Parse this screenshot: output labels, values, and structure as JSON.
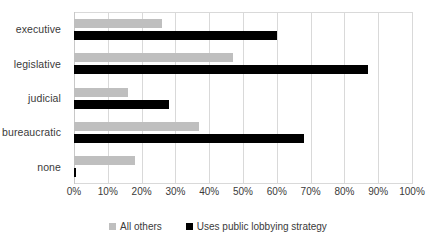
{
  "chart_data": {
    "type": "bar",
    "orientation": "horizontal",
    "title": "",
    "xlabel": "",
    "ylabel": "",
    "xlim": [
      0,
      100
    ],
    "xticks": [
      0,
      10,
      20,
      30,
      40,
      50,
      60,
      70,
      80,
      90,
      100
    ],
    "xtick_labels": [
      "0%",
      "10%",
      "20%",
      "30%",
      "40%",
      "50%",
      "60%",
      "70%",
      "80%",
      "90%",
      "100%"
    ],
    "grid": true,
    "grid_axis": "x",
    "legend_position": "bottom",
    "categories": [
      "executive",
      "legislative",
      "judicial",
      "bureaucratic",
      "none"
    ],
    "series": [
      {
        "name": "All others",
        "color": "#BFBFBF",
        "values": [
          26,
          47,
          16,
          37,
          18
        ]
      },
      {
        "name": "Uses public lobbying strategy",
        "color": "#000000",
        "values": [
          60,
          87,
          28,
          68,
          0.5
        ]
      }
    ]
  }
}
